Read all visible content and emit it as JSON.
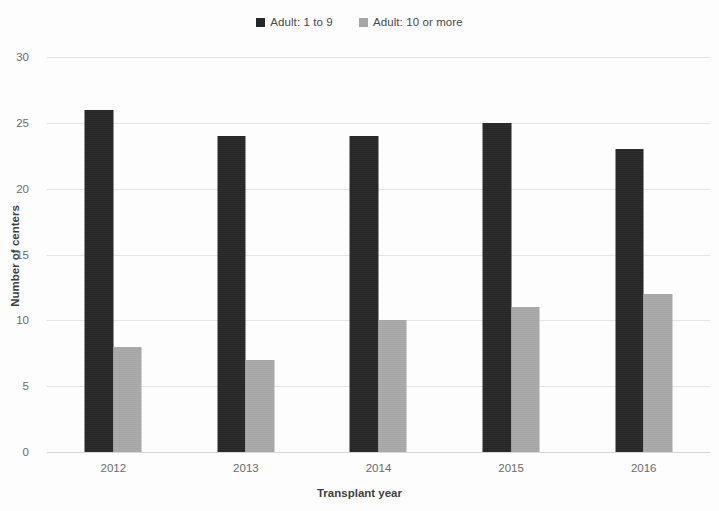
{
  "chart_data": {
    "type": "bar",
    "title": "",
    "xlabel": "Transplant year",
    "ylabel": "Number of centers",
    "categories": [
      "2012",
      "2013",
      "2014",
      "2015",
      "2016"
    ],
    "series": [
      {
        "name": "Adult: 1 to 9",
        "color": "#262626",
        "values": [
          26,
          24,
          24,
          25,
          23
        ]
      },
      {
        "name": "Adult: 10 or more",
        "color": "#a6a6a6",
        "values": [
          8,
          7,
          10,
          11,
          12
        ]
      }
    ],
    "ylim": [
      0,
      30
    ],
    "yticks": [
      0,
      5,
      10,
      15,
      20,
      25,
      30
    ],
    "ytick_labels": [
      "0",
      "5",
      "10",
      "15",
      "20",
      "25",
      "30"
    ],
    "grid": true,
    "legend_position": "top-center"
  }
}
